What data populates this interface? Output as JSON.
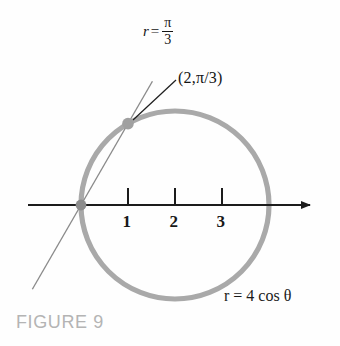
{
  "figure": {
    "caption": "FIGURE 9",
    "caption_color": "#b4b4b4",
    "background": "#fefefe"
  },
  "labels": {
    "theta_line": {
      "lead": "r",
      "equals": "=",
      "numerator": "π",
      "denominator": "3",
      "full_text": "r = π/3"
    },
    "point": "(2,π/3)",
    "curve_equation": "r = 4 cos θ"
  },
  "chart_data": {
    "type": "line",
    "title": "FIGURE 9",
    "subtitle": "Polar circle r = 4 cos θ with the ray θ = π/3",
    "coordinate_system": "polar",
    "xlabel": "",
    "ylabel": "",
    "grid": false,
    "legend": "none",
    "axis": {
      "name": "polar-axis",
      "orientation": "horizontal",
      "arrow_at": "right",
      "tick_labels": [
        "1",
        "2",
        "3"
      ],
      "tick_values": [
        1,
        2,
        3
      ],
      "xlim": [
        -1.1,
        5.0
      ],
      "ylim": [
        -2.3,
        3.3
      ],
      "color": "#1c1c1c"
    },
    "series": [
      {
        "name": "circle",
        "label": "r = 4 cos θ",
        "equation_polar": "r = 4 cos(theta)",
        "type": "circle",
        "center": [
          2,
          0
        ],
        "radius": 2,
        "color": "#a9a9a9",
        "linewidth": 5
      },
      {
        "name": "theta-ray",
        "label": "r = π/3",
        "equation_polar": "theta = pi/3",
        "type": "line",
        "through_origin": true,
        "angle_radians": 1.0471975512,
        "angle_degrees": 60,
        "color": "#8a8a8a",
        "linewidth": 1.3
      }
    ],
    "points": [
      {
        "name": "intersection-point",
        "label": "(2,π/3)",
        "polar": [
          2,
          1.0471975512
        ],
        "cartesian": [
          1,
          1.7320508
        ],
        "color": "#a0a0a0",
        "marker": "circle"
      },
      {
        "name": "origin-pole",
        "label": "",
        "polar": [
          0,
          0
        ],
        "cartesian": [
          0,
          0
        ],
        "color": "#8d8d8d",
        "marker": "circle"
      }
    ],
    "annotations": [
      {
        "name": "theta-ray-label",
        "text": "r = π/3",
        "at_cartesian": [
          0.85,
          3.1
        ]
      },
      {
        "name": "point-callout",
        "text": "(2,π/3)",
        "at_cartesian": [
          2.0,
          2.45
        ],
        "leader_line_to": [
          1.05,
          1.78
        ]
      },
      {
        "name": "curve-label",
        "text": "r = 4 cos θ",
        "at_cartesian": [
          3.05,
          -1.65
        ]
      }
    ]
  }
}
